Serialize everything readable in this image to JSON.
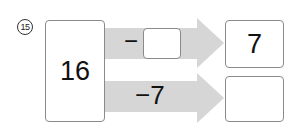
{
  "problem": {
    "number": "15",
    "start_value": "16",
    "top_path": {
      "operator": "−",
      "operand_box": "",
      "result": "7"
    },
    "bottom_path": {
      "operation": "−7",
      "result": ""
    }
  },
  "colors": {
    "arrow_fill": "#d6d6d6",
    "box_border": "#8a8a8a"
  }
}
